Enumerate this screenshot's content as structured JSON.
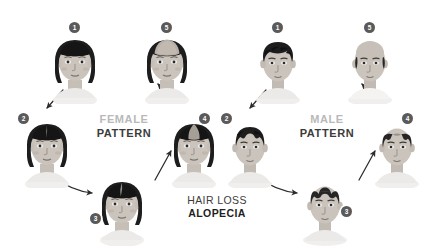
{
  "canvas": {
    "width": 434,
    "height": 245,
    "background": "#ffffff"
  },
  "theme": {
    "badge_bg": "#5a5a5a",
    "badge_text": "#ffffff",
    "label_muted": "#b9b9b9",
    "label_dark": "#3b3b3b",
    "hair_dark": "#1d1d1d",
    "skin": "#cfc9c2",
    "arrow": "#2b2b2b"
  },
  "labels": {
    "female": {
      "line1": "FEMALE",
      "line2": "PATTERN"
    },
    "male": {
      "line1": "MALE",
      "line2": "PATTERN"
    },
    "center": {
      "line1": "HAIR LOSS",
      "line2": "ALOPECIA"
    }
  },
  "female_stages": [
    {
      "number": "1",
      "stage": 1,
      "description": "full thick dark hair, normal density"
    },
    {
      "number": "2",
      "stage": 2,
      "description": "slight widening of the center part"
    },
    {
      "number": "3",
      "stage": 3,
      "description": "noticeable widening of part, diffuse thinning"
    },
    {
      "number": "4",
      "stage": 4,
      "description": "pronounced thinning across the crown"
    },
    {
      "number": "5",
      "stage": 5,
      "description": "severe diffuse thinning, scalp visible at crown"
    }
  ],
  "male_stages": [
    {
      "number": "1",
      "stage": 1,
      "description": "full wavy dark hair, intact hairline"
    },
    {
      "number": "2",
      "stage": 2,
      "description": "temples recede, early M-shaped hairline"
    },
    {
      "number": "3",
      "stage": 3,
      "description": "deeper temporal recession, thinning crown"
    },
    {
      "number": "4",
      "stage": 4,
      "description": "large bald area on top, hair on sides"
    },
    {
      "number": "5",
      "stage": 5,
      "description": "nearly bald crown, horseshoe rim of hair"
    }
  ],
  "icon_names": {
    "female_head": "female-head-icon",
    "male_head": "male-head-icon",
    "arrow": "arrow-icon"
  }
}
